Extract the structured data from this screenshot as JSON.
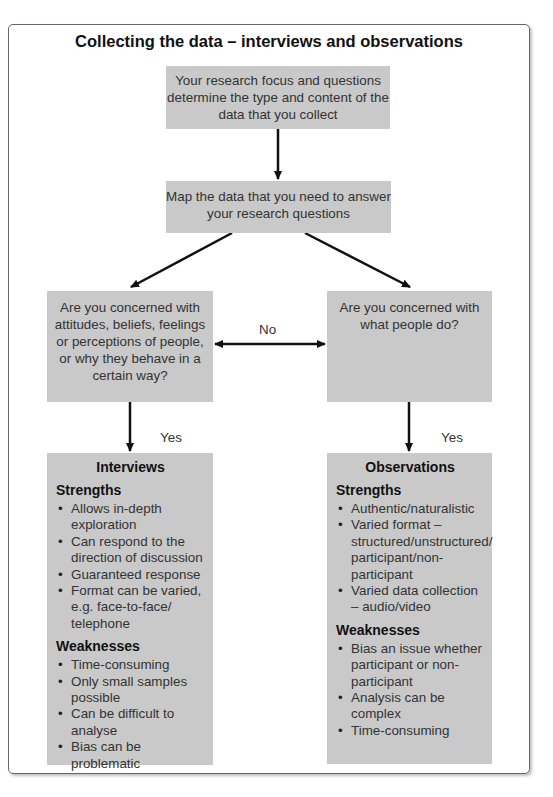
{
  "title": "Collecting the data – interviews and observations",
  "nodes": {
    "top": "Your research focus and questions determine the type and content of the data that you collect",
    "map": "Map the data that you need to answer your research questions",
    "left_question": "Are you concerned with attitudes, beliefs, feelings or perceptions of people, or why they behave in a certain way?",
    "right_question": "Are you concerned with what people do?"
  },
  "edge_labels": {
    "between_questions": "No",
    "left_yes": "Yes",
    "right_yes": "Yes"
  },
  "interviews": {
    "heading": "Interviews",
    "strengths_heading": "Strengths",
    "strengths": [
      "Allows in-depth exploration",
      "Can respond to the direction of discussion",
      "Guaranteed response",
      "Format can be varied, e.g. face-to-face/ telephone"
    ],
    "weaknesses_heading": "Weaknesses",
    "weaknesses": [
      "Time-consuming",
      "Only small samples possible",
      "Can be difficult to analyse",
      "Bias can be problematic"
    ]
  },
  "observations": {
    "heading": "Observations",
    "strengths_heading": "Strengths",
    "strengths": [
      "Authentic/naturalistic",
      "Varied format – structured/unstructured/ participant/non-participant",
      "Varied data collection – audio/video"
    ],
    "weaknesses_heading": "Weaknesses",
    "weaknesses": [
      "Bias an issue whether participant or non-participant",
      "Analysis can be complex",
      "Time-consuming"
    ]
  }
}
